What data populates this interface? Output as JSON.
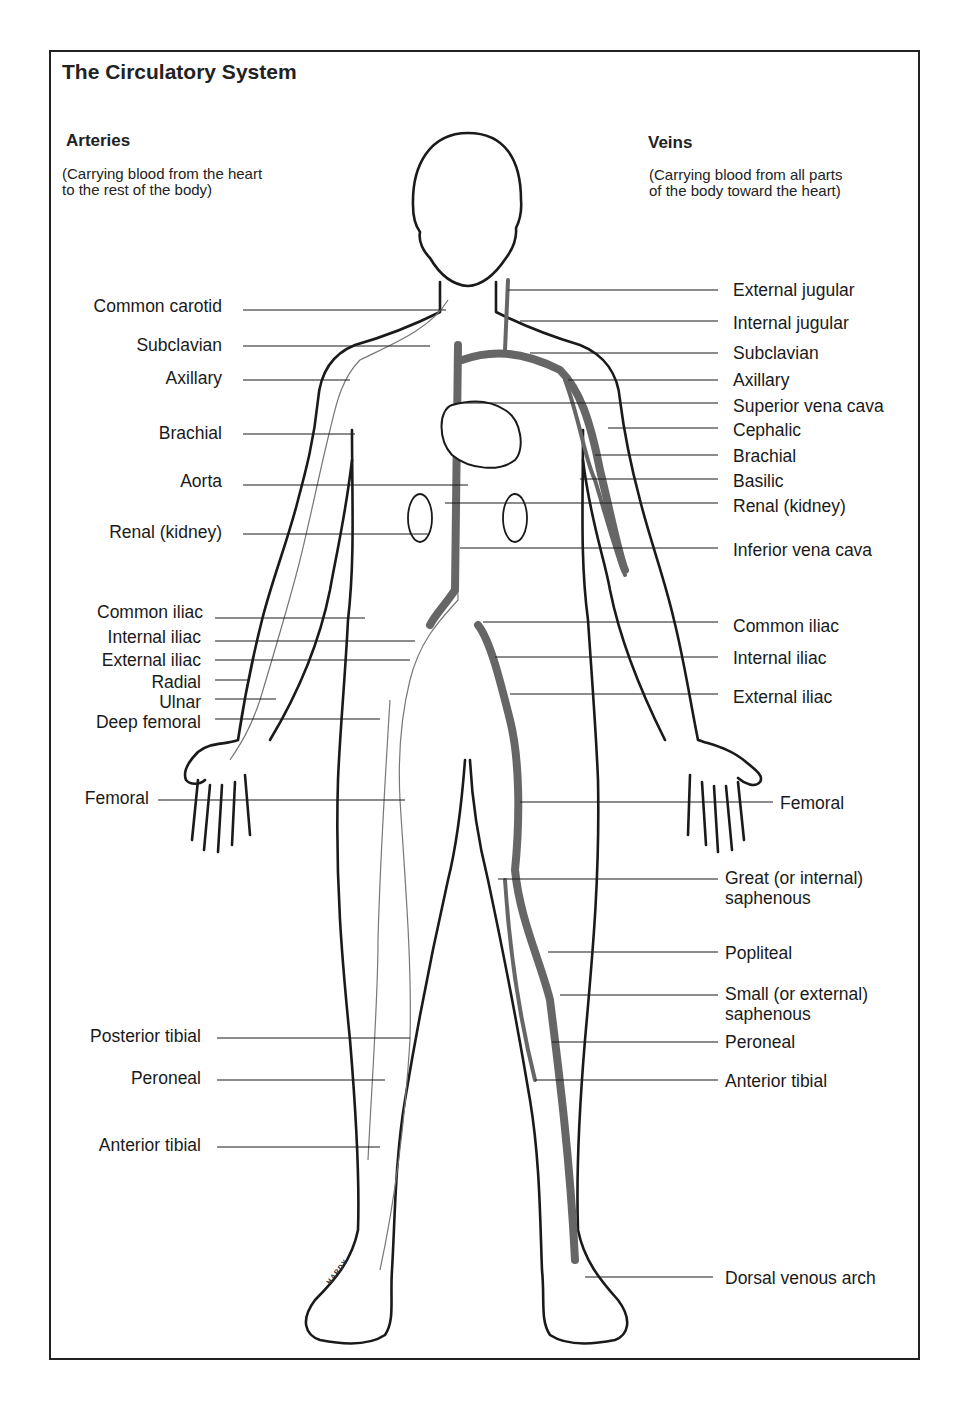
{
  "title": "The Circulatory System",
  "arteries": {
    "heading": "Arteries",
    "description_line1": "(Carrying blood from the heart",
    "description_line2": "to the rest of the body)",
    "labels": [
      {
        "text": "Common carotid",
        "y": 306
      },
      {
        "text": "Subclavian",
        "y": 345
      },
      {
        "text": "Axillary",
        "y": 378
      },
      {
        "text": "Brachial",
        "y": 433
      },
      {
        "text": "Aorta",
        "y": 481
      },
      {
        "text": "Renal (kidney)",
        "y": 532
      },
      {
        "text": "Common iliac",
        "y": 612
      },
      {
        "text": "Internal iliac",
        "y": 637
      },
      {
        "text": "External iliac",
        "y": 660
      },
      {
        "text": "Radial",
        "y": 682
      },
      {
        "text": "Ulnar",
        "y": 702
      },
      {
        "text": "Deep femoral",
        "y": 722
      },
      {
        "text": "Femoral",
        "y": 798
      },
      {
        "text": "Posterior tibial",
        "y": 1036
      },
      {
        "text": "Peroneal",
        "y": 1078
      },
      {
        "text": "Anterior tibial",
        "y": 1145
      }
    ]
  },
  "veins": {
    "heading": "Veins",
    "description_line1": "(Carrying blood from all parts",
    "description_line2": "of the body toward the heart)",
    "labels": [
      {
        "text": "External jugular",
        "y": 290
      },
      {
        "text": "Internal jugular",
        "y": 323
      },
      {
        "text": "Subclavian",
        "y": 353
      },
      {
        "text": "Axillary",
        "y": 380
      },
      {
        "text": "Superior vena cava",
        "y": 406
      },
      {
        "text": "Cephalic",
        "y": 430
      },
      {
        "text": "Brachial",
        "y": 456
      },
      {
        "text": "Basilic",
        "y": 481
      },
      {
        "text": "Renal (kidney)",
        "y": 506
      },
      {
        "text": "Inferior vena cava",
        "y": 550
      },
      {
        "text": "Common iliac",
        "y": 626
      },
      {
        "text": "Internal iliac",
        "y": 658
      },
      {
        "text": "External iliac",
        "y": 697
      },
      {
        "text": "Femoral",
        "y": 803
      },
      {
        "text": "Great (or internal)\nsaphenous",
        "y": 878
      },
      {
        "text": "Popliteal",
        "y": 953
      },
      {
        "text": "Small (or external)\nsaphenous",
        "y": 994
      },
      {
        "text": "Peroneal",
        "y": 1042
      },
      {
        "text": "Anterior tibial",
        "y": 1081
      },
      {
        "text": "Dorsal venous arch",
        "y": 1278
      }
    ]
  },
  "artist_signature": "HARDY"
}
